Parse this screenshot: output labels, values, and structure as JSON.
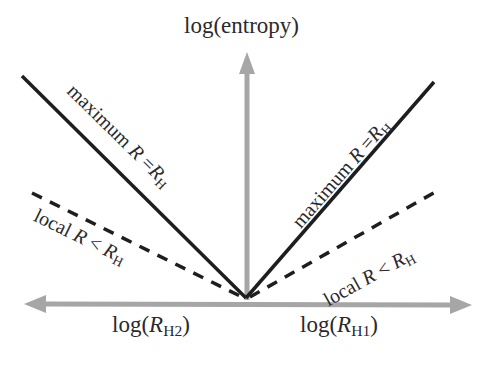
{
  "diagram": {
    "y_axis_label": "log(entropy)",
    "x_axis_left_label": {
      "prefix": "log(",
      "var": "R",
      "sub": "H2",
      "suffix": ")"
    },
    "x_axis_right_label": {
      "prefix": "log(",
      "var": "R",
      "sub": "H1",
      "suffix": ")"
    },
    "lines": [
      {
        "id": "max-left",
        "style": "solid",
        "label": {
          "word": "maximum ",
          "lhs": "R",
          "op": " =",
          "rhs": "R",
          "sub": "H"
        }
      },
      {
        "id": "local-left",
        "style": "dashed",
        "label": {
          "word": "local ",
          "lhs": "R",
          "op": " < ",
          "rhs": "R",
          "sub": "H"
        }
      },
      {
        "id": "max-right",
        "style": "solid",
        "label": {
          "word": "maximum ",
          "lhs": "R",
          "op": " =",
          "rhs": "R",
          "sub": "H"
        }
      },
      {
        "id": "local-right",
        "style": "dashed",
        "label": {
          "word": "local ",
          "lhs": "R",
          "op": " < ",
          "rhs": "R",
          "sub": "H"
        }
      }
    ],
    "colors": {
      "axis": "#a6a6a6",
      "line": "#1e1e1e",
      "text": "#2a2a2a"
    }
  }
}
